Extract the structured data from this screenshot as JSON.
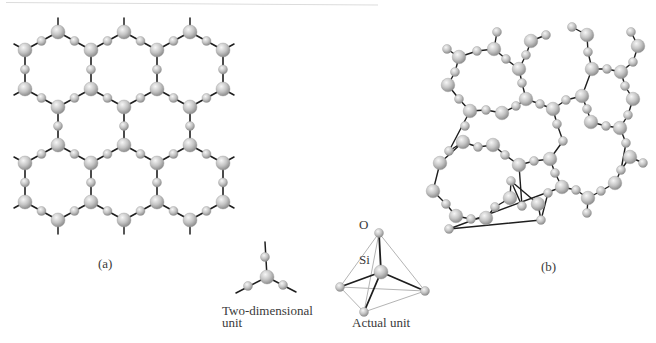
{
  "figure": {
    "panel_a": {
      "label": "(a)",
      "description": "Two-dimensional hexagonal network of SiO4 units (crystalline)"
    },
    "panel_b": {
      "label": "(b)",
      "description": "Random (amorphous) network of SiO4 units"
    },
    "units": {
      "two_dim_caption_line1": "Two-dimensional",
      "two_dim_caption_line2": "unit",
      "actual_caption": "Actual unit",
      "oxygen_label": "O",
      "silicon_label": "Si"
    }
  },
  "colors": {
    "background": "#ffffff",
    "bond": "#1e1e1e",
    "tetra_edge": "#b4b4b4",
    "atom_light": "#f4f4f4",
    "atom_mid": "#c6c6c6",
    "atom_dark": "#8e8e8e",
    "text": "#3a3a3a"
  },
  "lattice_a": {
    "si_radius": 7,
    "o_radius": 4.5,
    "columns_x": [
      25,
      58,
      91,
      124,
      157,
      190,
      223
    ],
    "rows_y": [
      32,
      50,
      89,
      107,
      145,
      163,
      202,
      220
    ],
    "stub_length": 14
  },
  "network_b": {
    "atoms": [
      {
        "x": 447,
        "y": 49,
        "t": "O"
      },
      {
        "x": 459,
        "y": 57,
        "t": "Si"
      },
      {
        "x": 477,
        "y": 51,
        "t": "O"
      },
      {
        "x": 494,
        "y": 49,
        "t": "Si"
      },
      {
        "x": 497,
        "y": 32,
        "t": "O"
      },
      {
        "x": 506,
        "y": 59,
        "t": "O"
      },
      {
        "x": 519,
        "y": 69,
        "t": "Si"
      },
      {
        "x": 522,
        "y": 83,
        "t": "O"
      },
      {
        "x": 455,
        "y": 72,
        "t": "O"
      },
      {
        "x": 448,
        "y": 85,
        "t": "Si"
      },
      {
        "x": 459,
        "y": 99,
        "t": "O"
      },
      {
        "x": 470,
        "y": 111,
        "t": "Si"
      },
      {
        "x": 486,
        "y": 110,
        "t": "O"
      },
      {
        "x": 502,
        "y": 113,
        "t": "Si"
      },
      {
        "x": 526,
        "y": 99,
        "t": "Si"
      },
      {
        "x": 516,
        "y": 106,
        "t": "O"
      },
      {
        "x": 531,
        "y": 41,
        "t": "Si"
      },
      {
        "x": 526,
        "y": 55,
        "t": "O"
      },
      {
        "x": 546,
        "y": 35,
        "t": "O"
      },
      {
        "x": 572,
        "y": 27,
        "t": "O"
      },
      {
        "x": 587,
        "y": 35,
        "t": "Si"
      },
      {
        "x": 588,
        "y": 52,
        "t": "O"
      },
      {
        "x": 592,
        "y": 69,
        "t": "Si"
      },
      {
        "x": 607,
        "y": 69,
        "t": "O"
      },
      {
        "x": 621,
        "y": 72,
        "t": "Si"
      },
      {
        "x": 625,
        "y": 86,
        "t": "O"
      },
      {
        "x": 633,
        "y": 99,
        "t": "Si"
      },
      {
        "x": 628,
        "y": 115,
        "t": "O"
      },
      {
        "x": 620,
        "y": 128,
        "t": "Si"
      },
      {
        "x": 606,
        "y": 126,
        "t": "O"
      },
      {
        "x": 591,
        "y": 122,
        "t": "Si"
      },
      {
        "x": 587,
        "y": 109,
        "t": "O"
      },
      {
        "x": 582,
        "y": 96,
        "t": "Si"
      },
      {
        "x": 566,
        "y": 100,
        "t": "O"
      },
      {
        "x": 553,
        "y": 109,
        "t": "Si"
      },
      {
        "x": 540,
        "y": 104,
        "t": "O"
      },
      {
        "x": 631,
        "y": 32,
        "t": "O"
      },
      {
        "x": 638,
        "y": 46,
        "t": "Si"
      },
      {
        "x": 633,
        "y": 62,
        "t": "O"
      },
      {
        "x": 557,
        "y": 124,
        "t": "O"
      },
      {
        "x": 563,
        "y": 141,
        "t": "O"
      },
      {
        "x": 463,
        "y": 142,
        "t": "Si"
      },
      {
        "x": 478,
        "y": 147,
        "t": "O"
      },
      {
        "x": 493,
        "y": 145,
        "t": "Si"
      },
      {
        "x": 505,
        "y": 155,
        "t": "O"
      },
      {
        "x": 519,
        "y": 165,
        "t": "Si"
      },
      {
        "x": 534,
        "y": 161,
        "t": "O"
      },
      {
        "x": 550,
        "y": 159,
        "t": "Si"
      },
      {
        "x": 555,
        "y": 173,
        "t": "O"
      },
      {
        "x": 562,
        "y": 187,
        "t": "Si"
      },
      {
        "x": 576,
        "y": 190,
        "t": "O"
      },
      {
        "x": 588,
        "y": 198,
        "t": "Si"
      },
      {
        "x": 601,
        "y": 191,
        "t": "O"
      },
      {
        "x": 615,
        "y": 183,
        "t": "Si"
      },
      {
        "x": 621,
        "y": 170,
        "t": "O"
      },
      {
        "x": 630,
        "y": 157,
        "t": "Si"
      },
      {
        "x": 643,
        "y": 163,
        "t": "O"
      },
      {
        "x": 626,
        "y": 143,
        "t": "O"
      },
      {
        "x": 587,
        "y": 213,
        "t": "O"
      },
      {
        "x": 465,
        "y": 126,
        "t": "O"
      },
      {
        "x": 449,
        "y": 151,
        "t": "O"
      },
      {
        "x": 440,
        "y": 163,
        "t": "Si"
      },
      {
        "x": 433,
        "y": 191,
        "t": "Si"
      },
      {
        "x": 446,
        "y": 204,
        "t": "O"
      },
      {
        "x": 456,
        "y": 216,
        "t": "Si"
      },
      {
        "x": 471,
        "y": 219,
        "t": "O"
      },
      {
        "x": 486,
        "y": 218,
        "t": "Si"
      },
      {
        "x": 495,
        "y": 207,
        "t": "O"
      },
      {
        "x": 510,
        "y": 198,
        "t": "Si"
      },
      {
        "x": 511,
        "y": 181,
        "t": "O"
      },
      {
        "x": 522,
        "y": 206,
        "t": "O"
      },
      {
        "x": 538,
        "y": 204,
        "t": "Si"
      },
      {
        "x": 541,
        "y": 220,
        "t": "O"
      },
      {
        "x": 548,
        "y": 193,
        "t": "O"
      },
      {
        "x": 449,
        "y": 229,
        "t": "O"
      }
    ],
    "bonds": [
      [
        0,
        1
      ],
      [
        1,
        2
      ],
      [
        2,
        3
      ],
      [
        3,
        4
      ],
      [
        3,
        5
      ],
      [
        5,
        6
      ],
      [
        6,
        7
      ],
      [
        1,
        8
      ],
      [
        8,
        9
      ],
      [
        9,
        10
      ],
      [
        10,
        11
      ],
      [
        11,
        12
      ],
      [
        12,
        13
      ],
      [
        13,
        15
      ],
      [
        15,
        14
      ],
      [
        7,
        14
      ],
      [
        6,
        17
      ],
      [
        17,
        16
      ],
      [
        16,
        18
      ],
      [
        19,
        20
      ],
      [
        20,
        21
      ],
      [
        21,
        22
      ],
      [
        22,
        23
      ],
      [
        23,
        24
      ],
      [
        24,
        25
      ],
      [
        25,
        26
      ],
      [
        26,
        27
      ],
      [
        27,
        28
      ],
      [
        28,
        29
      ],
      [
        29,
        30
      ],
      [
        30,
        31
      ],
      [
        31,
        32
      ],
      [
        32,
        33
      ],
      [
        33,
        34
      ],
      [
        34,
        35
      ],
      [
        35,
        14
      ],
      [
        22,
        32
      ],
      [
        36,
        37
      ],
      [
        37,
        38
      ],
      [
        38,
        24
      ],
      [
        34,
        39
      ],
      [
        39,
        40
      ],
      [
        11,
        60
      ],
      [
        60,
        41
      ],
      [
        41,
        42
      ],
      [
        42,
        43
      ],
      [
        43,
        44
      ],
      [
        44,
        45
      ],
      [
        45,
        46
      ],
      [
        46,
        47
      ],
      [
        47,
        40
      ],
      [
        47,
        48
      ],
      [
        48,
        49
      ],
      [
        49,
        50
      ],
      [
        50,
        51
      ],
      [
        51,
        52
      ],
      [
        52,
        53
      ],
      [
        53,
        54
      ],
      [
        54,
        55
      ],
      [
        55,
        56
      ],
      [
        54,
        57
      ],
      [
        57,
        28
      ],
      [
        51,
        58
      ],
      [
        41,
        61
      ],
      [
        61,
        62
      ],
      [
        45,
        70
      ],
      [
        70,
        69
      ],
      [
        63,
        64
      ],
      [
        64,
        65
      ],
      [
        65,
        66
      ],
      [
        66,
        67
      ],
      [
        67,
        68
      ],
      [
        68,
        69
      ],
      [
        69,
        71
      ],
      [
        71,
        72
      ],
      [
        72,
        74
      ],
      [
        72,
        73
      ],
      [
        49,
        74
      ],
      [
        63,
        75
      ],
      [
        62,
        63
      ]
    ]
  },
  "two_dim_unit": {
    "center": {
      "x": 267,
      "y": 277
    },
    "oxygens": [
      {
        "x": 265,
        "y": 257
      },
      {
        "x": 248,
        "y": 286
      },
      {
        "x": 283,
        "y": 285
      }
    ],
    "stubs": [
      {
        "x": 265,
        "y": 242
      },
      {
        "x": 236,
        "y": 293
      },
      {
        "x": 296,
        "y": 292
      }
    ]
  },
  "tetrahedron": {
    "top": {
      "x": 379,
      "y": 233
    },
    "si": {
      "x": 381,
      "y": 272
    },
    "left": {
      "x": 340,
      "y": 287
    },
    "right": {
      "x": 425,
      "y": 291
    },
    "bottom": {
      "x": 364,
      "y": 312
    }
  }
}
